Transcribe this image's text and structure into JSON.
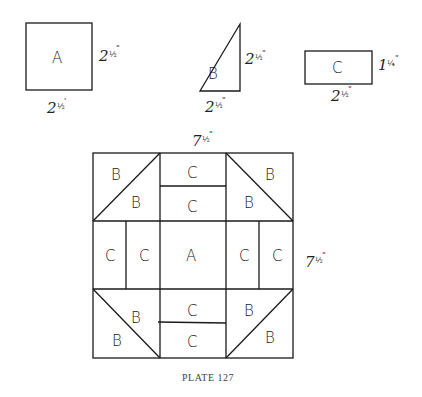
{
  "pieces": [
    {
      "label": "A",
      "shape": "square",
      "width": "2½\"",
      "height": "2½\""
    },
    {
      "label": "B",
      "shape": "right-triangle",
      "width": "2½\"",
      "height": "2½\""
    },
    {
      "label": "C",
      "shape": "rectangle",
      "width": "2½\"",
      "height": "1¼\""
    }
  ],
  "dims": {
    "a_side": {
      "whole": "2",
      "frac": "½",
      "mark": "\""
    },
    "a_bottom": {
      "whole": "2",
      "frac": "½",
      "mark": "'"
    },
    "b_side": {
      "whole": "2",
      "frac": "½",
      "mark": "\""
    },
    "b_bottom": {
      "whole": "2",
      "frac": "½",
      "mark": "\""
    },
    "c_side": {
      "whole": "1",
      "frac": "¼",
      "mark": "\""
    },
    "c_bottom": {
      "whole": "2",
      "frac": "½",
      "mark": "\""
    },
    "block_top": {
      "whole": "7",
      "frac": "½",
      "mark": "\""
    },
    "block_side": {
      "whole": "7",
      "frac": "½",
      "mark": "\""
    }
  },
  "block": {
    "labels": {
      "tl_outer": "B",
      "tl_inner": "B",
      "tm_top": "C",
      "tm_bottom": "C",
      "tr_outer": "B",
      "tr_inner": "B",
      "ml_left": "C",
      "ml_right": "C",
      "center": "A",
      "mr_left": "C",
      "mr_right": "C",
      "bl_inner": "B",
      "bl_outer": "B",
      "bm_top": "C",
      "bm_bottom": "C",
      "br_inner": "B",
      "br_outer": "B"
    }
  },
  "caption": "PLATE 127"
}
